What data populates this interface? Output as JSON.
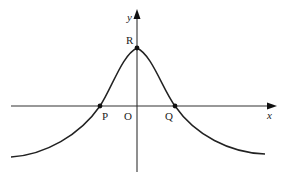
{
  "diagram": {
    "type": "function-graph",
    "axes": {
      "x_label": "x",
      "y_label": "y",
      "origin_label": "O"
    },
    "points": {
      "R": {
        "label": "R",
        "role": "maximum on y-axis"
      },
      "P": {
        "label": "P",
        "role": "x-intercept (left)"
      },
      "Q": {
        "label": "Q",
        "role": "x-intercept (right)"
      }
    },
    "colors": {
      "stroke": "#222222",
      "background": "#ffffff"
    }
  }
}
